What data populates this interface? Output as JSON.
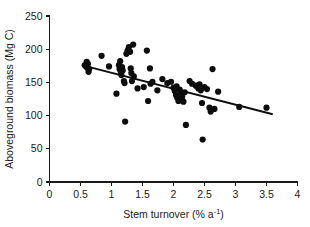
{
  "chart_data": {
    "type": "scatter",
    "title": "",
    "xlabel": "Stem turnover (% a⁻¹)",
    "xlabel_parts": {
      "base": "Stem turnover (% a",
      "superscript": "-1",
      "tail": ")"
    },
    "ylabel": "Aboveground biomass (Mg C)",
    "xlim": [
      0,
      4
    ],
    "ylim": [
      0,
      250
    ],
    "xticks": [
      0,
      0.5,
      1,
      1.5,
      2,
      2.5,
      3,
      3.5,
      4
    ],
    "xticklabels": [
      "0",
      "0.5",
      "1",
      "1.5",
      "2",
      "2.5",
      "3",
      "3.5",
      "4"
    ],
    "yticks": [
      0,
      50,
      100,
      150,
      200,
      250
    ],
    "yticklabels": [
      "0",
      "50",
      "100",
      "150",
      "200",
      "250"
    ],
    "grid": false,
    "legend": null,
    "marker": {
      "shape": "circle",
      "color": "#0d0d0d",
      "size_px": 4.1
    },
    "points": [
      [
        0.57,
        176
      ],
      [
        0.59,
        174
      ],
      [
        0.6,
        181
      ],
      [
        0.61,
        172
      ],
      [
        0.62,
        178
      ],
      [
        0.63,
        166
      ],
      [
        0.64,
        170
      ],
      [
        0.84,
        190
      ],
      [
        0.96,
        174
      ],
      [
        1.08,
        133
      ],
      [
        1.12,
        176
      ],
      [
        1.13,
        170
      ],
      [
        1.14,
        182
      ],
      [
        1.15,
        166
      ],
      [
        1.16,
        161
      ],
      [
        1.17,
        173
      ],
      [
        1.18,
        168
      ],
      [
        1.2,
        152
      ],
      [
        1.21,
        149
      ],
      [
        1.22,
        91
      ],
      [
        1.24,
        193
      ],
      [
        1.26,
        198
      ],
      [
        1.28,
        203
      ],
      [
        1.3,
        196
      ],
      [
        1.31,
        171
      ],
      [
        1.32,
        164
      ],
      [
        1.33,
        152
      ],
      [
        1.35,
        207
      ],
      [
        1.36,
        159
      ],
      [
        1.42,
        141
      ],
      [
        1.52,
        143
      ],
      [
        1.57,
        198
      ],
      [
        1.59,
        122
      ],
      [
        1.62,
        171
      ],
      [
        1.63,
        148
      ],
      [
        1.66,
        151
      ],
      [
        1.74,
        138
      ],
      [
        1.82,
        155
      ],
      [
        1.9,
        149
      ],
      [
        1.96,
        151
      ],
      [
        2.0,
        142
      ],
      [
        2.02,
        137
      ],
      [
        2.04,
        131
      ],
      [
        2.05,
        144
      ],
      [
        2.06,
        127
      ],
      [
        2.08,
        122
      ],
      [
        2.1,
        139
      ],
      [
        2.12,
        134
      ],
      [
        2.14,
        128
      ],
      [
        2.16,
        121
      ],
      [
        2.18,
        135
      ],
      [
        2.2,
        86
      ],
      [
        2.26,
        152
      ],
      [
        2.3,
        148
      ],
      [
        2.36,
        145
      ],
      [
        2.4,
        141
      ],
      [
        2.42,
        147
      ],
      [
        2.44,
        138
      ],
      [
        2.46,
        119
      ],
      [
        2.47,
        64
      ],
      [
        2.5,
        143
      ],
      [
        2.54,
        140
      ],
      [
        2.58,
        112
      ],
      [
        2.6,
        106
      ],
      [
        2.63,
        170
      ],
      [
        2.66,
        110
      ],
      [
        2.72,
        136
      ],
      [
        3.06,
        113
      ],
      [
        3.5,
        112
      ]
    ],
    "fit_line": {
      "x": [
        0.52,
        3.6
      ],
      "y": [
        176,
        102
      ]
    }
  }
}
